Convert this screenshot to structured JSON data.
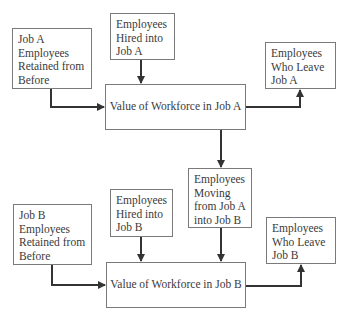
{
  "diagram": {
    "type": "flowchart",
    "colors": {
      "background": "#ffffff",
      "box_border": "#7a7a7a",
      "arrow": "#333333",
      "text": "#3a3a3a"
    },
    "nodes": {
      "retained_a": {
        "lines": [
          "Job A",
          "Employees",
          "Retained from",
          "Before"
        ]
      },
      "hired_a": {
        "lines": [
          "Employees",
          "Hired into",
          "Job A"
        ]
      },
      "value_a": {
        "label": "Value of Workforce in Job A"
      },
      "leave_a": {
        "lines": [
          "Employees",
          "Who Leave",
          "Job A"
        ]
      },
      "moving_ab": {
        "lines": [
          "Employees",
          "Moving",
          "from Job A",
          "into Job B"
        ]
      },
      "retained_b": {
        "lines": [
          "Job B",
          "Employees",
          "Retained from",
          "Before"
        ]
      },
      "hired_b": {
        "lines": [
          "Employees",
          "Hired into",
          "Job B"
        ]
      },
      "value_b": {
        "label": "Value of Workforce in Job B"
      },
      "leave_b": {
        "lines": [
          "Employees",
          "Who Leave",
          "Job B"
        ]
      }
    },
    "edges": [
      {
        "from": "retained_a",
        "to": "value_a"
      },
      {
        "from": "hired_a",
        "to": "value_a"
      },
      {
        "from": "value_a",
        "to": "leave_a"
      },
      {
        "from": "value_a",
        "to": "moving_ab"
      },
      {
        "from": "retained_b",
        "to": "value_b"
      },
      {
        "from": "hired_b",
        "to": "value_b"
      },
      {
        "from": "moving_ab",
        "to": "value_b"
      },
      {
        "from": "value_b",
        "to": "leave_b"
      }
    ]
  }
}
